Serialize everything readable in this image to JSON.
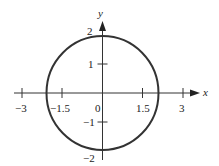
{
  "diagram": {
    "type": "circle-on-coordinate-plane",
    "shape": {
      "kind": "circle",
      "center": [
        0,
        0
      ],
      "radius": 2
    },
    "x_axis": {
      "label": "x",
      "ticks": [
        {
          "value": -3,
          "label": "−3"
        },
        {
          "value": -1.5,
          "label": "−1.5"
        },
        {
          "value": 1.5,
          "label": "1.5"
        },
        {
          "value": 3,
          "label": "3"
        }
      ]
    },
    "y_axis": {
      "label": "y",
      "ticks": [
        {
          "value": 2,
          "label": "2"
        },
        {
          "value": 1,
          "label": "1"
        },
        {
          "value": -1,
          "label": "−1"
        },
        {
          "value": -2,
          "label": "−2"
        }
      ]
    },
    "origin_label": "0",
    "colors": {
      "stroke": "#333333",
      "background": "#ffffff"
    }
  }
}
